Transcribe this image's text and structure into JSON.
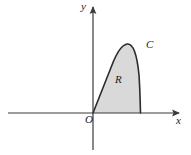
{
  "figure": {
    "type": "cartesian-diagram",
    "background_color": "#ffffff",
    "axes": {
      "x_axis": {
        "label": "x",
        "stroke_color": "#3a3a3a",
        "start_x": 8,
        "end_x": 180,
        "y": 113,
        "arrow": "right"
      },
      "y_axis": {
        "label": "y",
        "stroke_color": "#3a3a3a",
        "x": 93,
        "start_y": 6,
        "end_y": 150,
        "arrow": "up"
      },
      "origin": {
        "label": "O",
        "x": 93,
        "y": 113
      }
    },
    "curve": {
      "label": "C",
      "stroke_color": "#2b2b2b",
      "stroke_width": 1.6,
      "fill_color": "#d9d9d9",
      "start_point": [
        93,
        113
      ],
      "peak_point": [
        127,
        44
      ],
      "end_point": [
        140,
        113
      ]
    },
    "region": {
      "label": "R",
      "fill_color": "#d9d9d9"
    }
  }
}
